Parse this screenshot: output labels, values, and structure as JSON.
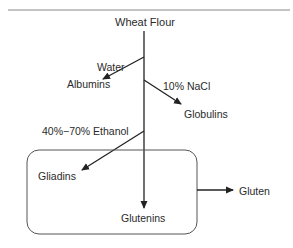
{
  "diagram": {
    "type": "flowchart",
    "nodes": {
      "root": "Wheat Flour",
      "albumins": "Albumins",
      "globulins": "Globulins",
      "gliadins": "Gliadins",
      "glutenins": "Glutenins",
      "gluten": "Gluten"
    },
    "edges": {
      "water": "Water",
      "nacl": "10% NaCl",
      "ethanol": "40%−70% Ethanol"
    },
    "group": {
      "members": [
        "Gliadins",
        "Glutenins"
      ],
      "output": "Gluten"
    },
    "colors": {
      "line": "#222222",
      "text": "#2a2a2a",
      "box": "#555555",
      "rule": "#888888"
    }
  }
}
